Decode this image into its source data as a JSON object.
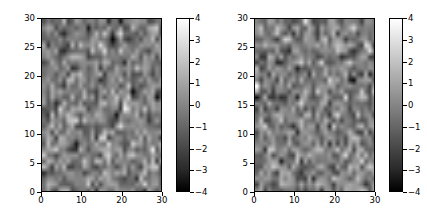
{
  "figure": {
    "background_color": "#ffffff",
    "text_color": "#000000",
    "width": 427,
    "height": 222
  },
  "chart_data": [
    {
      "type": "heatmap",
      "title": "",
      "xlabel": "",
      "ylabel": "",
      "colormap": "gray",
      "nrows": 30,
      "ncols": 30,
      "xlim": [
        0,
        30
      ],
      "ylim": [
        0,
        30
      ],
      "grid": false,
      "origin": "lower",
      "xticks": [
        0,
        10,
        20,
        30
      ],
      "xticklabels": [
        "0",
        "10",
        "20",
        "30"
      ],
      "yticks": [
        0,
        5,
        10,
        15,
        20,
        25,
        30
      ],
      "yticklabels": [
        "0",
        "5",
        "10",
        "15",
        "20",
        "25",
        "30"
      ],
      "colorbar": {
        "position": "right",
        "vmin": -4,
        "vmax": 4,
        "ticks": [
          4,
          3,
          2,
          1,
          0,
          -1,
          -2,
          -3,
          -4
        ],
        "ticklabels": [
          "4",
          "3",
          "2",
          "1",
          "0",
          "−1",
          "−2",
          "−3",
          "−4"
        ]
      },
      "seed": 17,
      "distribution": "normal",
      "mean": 0,
      "std": 1.15
    },
    {
      "type": "heatmap",
      "title": "",
      "xlabel": "",
      "ylabel": "",
      "colormap": "gray",
      "nrows": 30,
      "ncols": 30,
      "xlim": [
        0,
        30
      ],
      "ylim": [
        0,
        30
      ],
      "grid": false,
      "origin": "lower",
      "xticks": [
        0,
        10,
        20,
        30
      ],
      "xticklabels": [
        "0",
        "10",
        "20",
        "30"
      ],
      "yticks": [
        0,
        5,
        10,
        15,
        20,
        25,
        30
      ],
      "yticklabels": [
        "0",
        "5",
        "10",
        "15",
        "20",
        "25",
        "30"
      ],
      "colorbar": {
        "position": "right",
        "vmin": -4,
        "vmax": 4,
        "ticks": [
          4,
          3,
          2,
          1,
          0,
          -1,
          -2,
          -3,
          -4
        ],
        "ticklabels": [
          "4",
          "3",
          "2",
          "1",
          "0",
          "−1",
          "−2",
          "−3",
          "−4"
        ]
      },
      "seed": 93,
      "distribution": "normal",
      "mean": 0,
      "std": 1.15
    }
  ]
}
